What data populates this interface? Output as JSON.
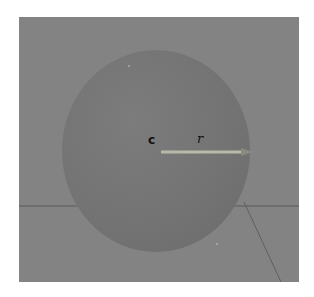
{
  "figure": {
    "background_color": "#838383",
    "sphere_color": "#747474",
    "arrow_color": "#b8b8a8",
    "grid_line_color": "#555555",
    "labels": {
      "center": "c",
      "radius": "r"
    }
  }
}
